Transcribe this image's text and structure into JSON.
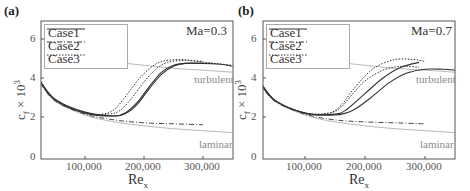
{
  "chart_data": [
    {
      "type": "line",
      "panel": "(a)",
      "annotation": "Ma=0.3",
      "xlabel": "Re_x",
      "ylabel": "c_f × 10^3",
      "xlim": [
        25000,
        350000
      ],
      "ylim": [
        0,
        6.9
      ],
      "x_ticks": [
        "100,000",
        "200,000",
        "300,000"
      ],
      "y_ticks": [
        "0",
        "2",
        "4",
        "6"
      ],
      "legend": [
        "Case1",
        "Case2",
        "Case3"
      ],
      "region_labels": [
        "turbulent",
        "laminar"
      ],
      "series": [
        {
          "name": "laminar",
          "style": "thin-gray",
          "x": [
            25000,
            50000,
            100000,
            150000,
            200000,
            250000,
            300000,
            350000
          ],
          "y": [
            3.7,
            2.8,
            2.1,
            1.75,
            1.55,
            1.4,
            1.3,
            1.2
          ]
        },
        {
          "name": "turbulent",
          "style": "thin-gray",
          "x": [
            110000,
            200000,
            250000,
            300000,
            350000
          ],
          "y": [
            4.95,
            4.65,
            4.5,
            4.4,
            4.3
          ]
        },
        {
          "name": "Case1",
          "style": "solid",
          "x": [
            25000,
            50000,
            100000,
            150000,
            170000,
            190000,
            210000,
            230000,
            250000,
            270000,
            300000,
            330000,
            350000
          ],
          "y": [
            3.8,
            2.9,
            2.25,
            2.05,
            2.2,
            2.7,
            3.5,
            4.2,
            4.6,
            4.75,
            4.75,
            4.7,
            4.6
          ]
        },
        {
          "name": "Case1b",
          "style": "solid",
          "x": [
            25000,
            50000,
            100000,
            150000,
            170000,
            190000,
            210000,
            230000,
            250000,
            270000,
            300000
          ],
          "y": [
            3.75,
            2.85,
            2.2,
            2.05,
            2.25,
            2.8,
            3.6,
            4.3,
            4.65,
            4.75,
            4.75
          ]
        },
        {
          "name": "Case2",
          "style": "dashdot",
          "x": [
            25000,
            50000,
            100000,
            150000,
            200000,
            250000,
            300000
          ],
          "y": [
            3.7,
            2.8,
            2.15,
            1.85,
            1.7,
            1.65,
            1.6
          ]
        },
        {
          "name": "Case3",
          "style": "dotted",
          "x": [
            25000,
            50000,
            100000,
            130000,
            150000,
            170000,
            190000,
            210000,
            230000,
            260000,
            290000,
            320000,
            350000
          ],
          "y": [
            3.75,
            2.85,
            2.2,
            2.15,
            2.4,
            3.1,
            3.9,
            4.5,
            4.85,
            4.95,
            4.85,
            4.75,
            4.65
          ]
        },
        {
          "name": "Case3b",
          "style": "dotted",
          "x": [
            25000,
            50000,
            100000,
            140000,
            160000,
            180000,
            200000,
            220000,
            240000,
            270000,
            300000
          ],
          "y": [
            3.75,
            2.85,
            2.2,
            2.15,
            2.35,
            3.0,
            3.8,
            4.45,
            4.8,
            4.9,
            4.85
          ]
        }
      ]
    },
    {
      "type": "line",
      "panel": "(b)",
      "annotation": "Ma=0.7",
      "xlabel": "Re_x",
      "ylabel": "c_f × 10^3",
      "xlim": [
        25000,
        350000
      ],
      "ylim": [
        0,
        6.9
      ],
      "x_ticks": [
        "100,000",
        "200,000",
        "300,000"
      ],
      "y_ticks": [
        "0",
        "2",
        "4",
        "6"
      ],
      "legend": [
        "Case1",
        "Case2",
        "Case3"
      ],
      "region_labels": [
        "turbulent",
        "laminar"
      ],
      "series": [
        {
          "name": "laminar",
          "style": "thin-gray",
          "x": [
            25000,
            50000,
            100000,
            150000,
            200000,
            250000,
            300000,
            350000
          ],
          "y": [
            3.7,
            2.8,
            2.1,
            1.75,
            1.55,
            1.4,
            1.3,
            1.2
          ]
        },
        {
          "name": "turbulent",
          "style": "thin-gray",
          "x": [
            110000,
            200000,
            250000,
            300000,
            350000
          ],
          "y": [
            4.95,
            4.65,
            4.5,
            4.4,
            4.3
          ]
        },
        {
          "name": "Case1",
          "style": "solid",
          "x": [
            25000,
            50000,
            100000,
            150000,
            180000,
            210000,
            240000,
            270000,
            300000,
            330000,
            350000
          ],
          "y": [
            3.8,
            2.85,
            2.2,
            2.1,
            2.35,
            3.0,
            3.75,
            4.25,
            4.45,
            4.45,
            4.4
          ]
        },
        {
          "name": "Case1b",
          "style": "solid",
          "x": [
            25000,
            50000,
            100000,
            150000,
            170000,
            200000,
            230000,
            260000,
            290000
          ],
          "y": [
            3.8,
            2.85,
            2.2,
            2.15,
            2.4,
            3.2,
            4.0,
            4.55,
            4.8
          ]
        },
        {
          "name": "Case2",
          "style": "dashdot",
          "x": [
            25000,
            50000,
            100000,
            150000,
            200000,
            250000,
            300000
          ],
          "y": [
            3.7,
            2.8,
            2.15,
            1.85,
            1.75,
            1.7,
            1.65
          ]
        },
        {
          "name": "Case3",
          "style": "dotted",
          "x": [
            25000,
            50000,
            100000,
            140000,
            160000,
            180000,
            200000,
            220000,
            250000,
            280000,
            300000
          ],
          "y": [
            3.75,
            2.85,
            2.2,
            2.2,
            2.6,
            3.4,
            4.1,
            4.6,
            4.95,
            4.95,
            4.85
          ]
        },
        {
          "name": "Case3b",
          "style": "dotted",
          "x": [
            25000,
            50000,
            100000,
            140000,
            160000,
            180000,
            200000,
            230000,
            260000,
            290000
          ],
          "y": [
            3.75,
            2.85,
            2.2,
            2.2,
            2.5,
            3.2,
            3.85,
            4.4,
            4.6,
            4.55
          ]
        }
      ]
    }
  ],
  "panels": [
    {
      "label": "(a)",
      "ma": "Ma=0.3",
      "ylabel": "c",
      "ylabel_sub": "f",
      "ylabel_rest": " × 10",
      "ylabel_sup": "3",
      "xlabel": "Re",
      "xlabel_sub": "x",
      "legend": [
        {
          "label": "Case1"
        },
        {
          "label": "Case2"
        },
        {
          "label": "Case3"
        }
      ],
      "x_ticks": [
        "100,000",
        "200,000",
        "300,000"
      ],
      "y_ticks": [
        "6",
        "4",
        "2",
        "0"
      ],
      "turbulent": "turbulent",
      "laminar": "laminar"
    },
    {
      "label": "(b)",
      "ma": "Ma=0.7",
      "ylabel": "c",
      "ylabel_sub": "f",
      "ylabel_rest": " × 10",
      "ylabel_sup": "3",
      "xlabel": "Re",
      "xlabel_sub": "x",
      "legend": [
        {
          "label": "Case1"
        },
        {
          "label": "Case2"
        },
        {
          "label": "Case3"
        }
      ],
      "x_ticks": [
        "100,000",
        "200,000",
        "300,000"
      ],
      "y_ticks": [
        "6",
        "4",
        "2",
        "0"
      ],
      "turbulent": "turbulent",
      "laminar": "laminar"
    }
  ],
  "colors": {
    "axis": "#555555",
    "curve": "#333333",
    "reference": "#b0b0b0",
    "label_gray": "#8a8a8a"
  }
}
